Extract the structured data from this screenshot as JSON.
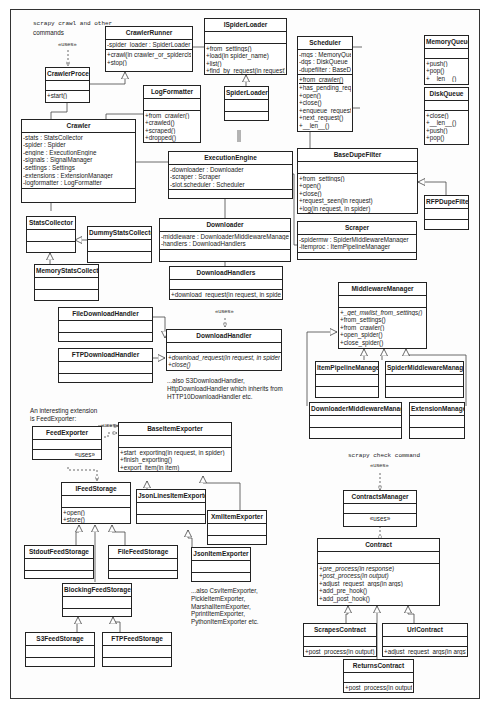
{
  "diagram": {
    "type": "UML class diagram",
    "notes": {
      "crawl_cmd": "scrapy  crawl and other",
      "crawl_cmd2": "commands",
      "crawl_uses": "«uses»",
      "downloadhandler_uses": "«uses»",
      "s3_note1": "...also S3DownloadHandler,",
      "s3_note2": "HttpDownloadHandler which inherits from",
      "s3_note3": "HTTP10DownloadHandler etc.",
      "feed_note1": "An interesting extension",
      "feed_note2": "is FeedExporter:",
      "feed_uses_top": "«uses»",
      "exporter_note1": "...also CsvItemExporter,",
      "exporter_note2": "PickleItemExporter,",
      "exporter_note3": "MarshalItemExporter,",
      "exporter_note4": "PprintItemExporter,",
      "exporter_note5": "PythonItemExporter etc.",
      "check_cmd": "scrapy  check command",
      "check_uses": "«uses»"
    },
    "classes": {
      "CrawlerRunner": {
        "name": "CrawlerRunner",
        "attrs": [
          "-spider_loader : SpiderLoader"
        ],
        "ops": [
          "+crawl(in crawler_or_spidercls)",
          "+stop()"
        ]
      },
      "ISpiderLoader": {
        "name": "ISpiderLoader",
        "attrs": [],
        "ops": [
          "+from_settings()",
          "+load(in spider_name)",
          "+list()",
          "+find_by_request(in request)"
        ]
      },
      "SpiderLoader": {
        "name": "SpiderLoader"
      },
      "Scheduler": {
        "name": "Scheduler",
        "attrs": [
          "-mqs : MemoryQueue",
          "-dqs : DiskQueue",
          "-dupefilter : BaseDupeFilter"
        ],
        "ops": [
          "+from_crawler()",
          "+has_pending_requests()",
          "+open()",
          "+close()",
          "+enqueue_request()",
          "+next_request()",
          "+__len__()"
        ]
      },
      "MemoryQueue": {
        "name": "MemoryQueue",
        "ops": [
          "+push()",
          "+pop()",
          "+__len__()"
        ]
      },
      "DiskQueue": {
        "name": "DiskQueue",
        "ops": [
          "+close()",
          "+__len__()",
          "+push()",
          "+pop()"
        ]
      },
      "CrawlerProcess": {
        "name": "CrawlerProcess",
        "ops": [
          "+start()"
        ]
      },
      "LogFormatter": {
        "name": "LogFormatter",
        "ops": [
          "+from_crawler()",
          "+crawled()",
          "+scraped()",
          "+dropped()"
        ]
      },
      "Crawler": {
        "name": "Crawler",
        "attrs": [
          "-stats : StatsCollector",
          "-spider : Spider",
          "-engine : ExecutionEngine",
          "-signals : SignalManager",
          "-settings : Settings",
          "-extensions : ExtensionManager",
          "-logformatter : LogFormatter"
        ]
      },
      "ExecutionEngine": {
        "name": "ExecutionEngine",
        "attrs": [
          "-downloader : Downloader",
          "-scraper  : Scraper",
          "-slot.scheduler : Scheduler"
        ]
      },
      "BaseDupeFilter": {
        "name": "BaseDupeFilter",
        "ops": [
          "+from_settings()",
          "+open()",
          "+close()",
          "+request_seen(in request)",
          "+log(in request, in spider)"
        ]
      },
      "RFPDupeFilter": {
        "name": "RFPDupeFilter"
      },
      "StatsCollector": {
        "name": "StatsCollector"
      },
      "DummyStatsCollector": {
        "name": "DummyStatsCollector"
      },
      "MemoryStatsCollector": {
        "name": "MemoryStatsCollector"
      },
      "Downloader": {
        "name": "Downloader",
        "attrs": [
          "-middleware : DownloaderMiddlewareManager",
          "-handlers : DownloadHandlers"
        ]
      },
      "Scraper": {
        "name": "Scraper",
        "attrs": [
          "-spidermw : SpiderMiddlewareManager",
          "-itemproc : ItemPipelineManager"
        ]
      },
      "DownloadHandlers": {
        "name": "DownloadHandlers",
        "ops": [
          "+download_request(in request, in spider)"
        ]
      },
      "FileDownloadHandler": {
        "name": "FileDownloadHandler"
      },
      "FTPDownloadHandler": {
        "name": "FTPDownloadHandler"
      },
      "DownloadHandler": {
        "name": "DownloadHandler",
        "ops": [
          "+download_request(in request, in spider)",
          "+close()"
        ]
      },
      "MiddlewareManager": {
        "name": "MiddlewareManager",
        "ops": [
          "+_get_mwlist_from_settings()",
          "+from_settings()",
          "+from_crawler()",
          "+open_spider()",
          "+close_spider()"
        ]
      },
      "ItemPipelineManager": {
        "name": "ItemPipelineManager"
      },
      "SpiderMiddlewareManager": {
        "name": "SpiderMiddlewareManager"
      },
      "DownloaderMiddlewareManager": {
        "name": "DownloaderMiddlewareManager"
      },
      "ExtensionManager": {
        "name": "ExtensionManager"
      },
      "FeedExporter": {
        "name": "FeedExporter",
        "ops": [
          "«uses»"
        ]
      },
      "BaseItemExporter": {
        "name": "BaseItemExporter",
        "ops": [
          "+start_exporting(in request, in spider)",
          "+finish_exporting()",
          "+export_item(in item)"
        ]
      },
      "IFeedStorage": {
        "name": "IFeedStorage",
        "ops": [
          "+open()",
          "+store()"
        ]
      },
      "JsonLinesItemExporter": {
        "name": "JsonLinesItemExporter"
      },
      "XmlItemExporter": {
        "name": "XmlItemExporter"
      },
      "JsonItemExporter": {
        "name": "JsonItemExporter"
      },
      "StdoutFeedStorage": {
        "name": "StdoutFeedStorage"
      },
      "FileFeedStorage": {
        "name": "FileFeedStorage"
      },
      "BlockingFeedStorage": {
        "name": "BlockingFeedStorage"
      },
      "S3FeedStorage": {
        "name": "S3FeedStorage"
      },
      "FTPFeedStorage": {
        "name": "FTPFeedStorage"
      },
      "ContractsManager": {
        "name": "ContractsManager",
        "ops": [
          "«uses»"
        ]
      },
      "Contract": {
        "name": "Contract",
        "ops": [
          "+pre_process(in response)",
          "+post_process(in output)",
          "+adjust_request_args(in args)",
          "+add_pre_hook()",
          "+add_post_hook()"
        ]
      },
      "ScrapesContract": {
        "name": "ScrapesContract",
        "ops": [
          "+post_process(in output)"
        ]
      },
      "UrlContract": {
        "name": "UrlContract",
        "ops": [
          "+adjust_request_args(in args)"
        ]
      },
      "ReturnsContract": {
        "name": "ReturnsContract",
        "ops": [
          "+post_process(in output)"
        ]
      }
    }
  }
}
